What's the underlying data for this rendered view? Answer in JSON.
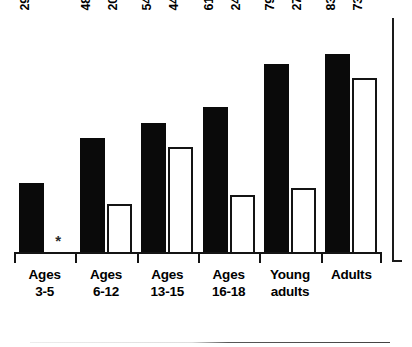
{
  "chart_data": {
    "type": "bar",
    "title": "",
    "subtitle": "",
    "xlabel": "",
    "ylabel": "",
    "ylim": [
      0,
      100
    ],
    "grid": false,
    "legend": "none",
    "orientation": "vertical",
    "grouping": "grouped",
    "value_label_suffix": "%",
    "value_label_rotation": "90deg-ccw",
    "categories": [
      "Ages 3-5",
      "Ages 6-12",
      "Ages 13-15",
      "Ages 16-18",
      "Young adults",
      "Adults"
    ],
    "category_lines": [
      [
        "Ages",
        "3-5"
      ],
      [
        "Ages",
        "6-12"
      ],
      [
        "Ages",
        "13-15"
      ],
      [
        "Ages",
        "16-18"
      ],
      [
        "Young",
        "adults"
      ],
      [
        "Adults",
        ""
      ]
    ],
    "series": [
      {
        "name": "black",
        "fill": "#0a0a0a",
        "values": [
          29,
          48,
          54,
          61,
          79,
          83
        ],
        "labels": [
          "29%",
          "48%",
          "54%",
          "61%",
          "79%",
          "83%"
        ]
      },
      {
        "name": "white",
        "fill": "#ffffff",
        "values": [
          null,
          20,
          44,
          24,
          27,
          73
        ],
        "labels": [
          "",
          "20%",
          "44%**",
          "24%",
          "27%",
          "73%"
        ],
        "missing_marker": "*"
      }
    ],
    "annotations": [
      {
        "text": "*",
        "category": "Ages 3-5",
        "series": "white",
        "meaning": "no-data-marker"
      },
      {
        "text": "**",
        "category": "Ages 13-15",
        "series": "white",
        "meaning": "footnote-marker"
      }
    ]
  },
  "colors": {
    "ink": "#0a0a0a",
    "axis": "#141414",
    "background": "#ffffff"
  }
}
